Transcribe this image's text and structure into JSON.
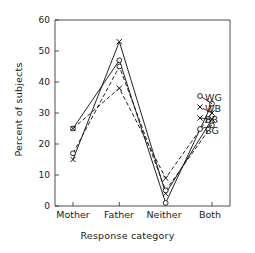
{
  "chart_data": {
    "type": "line",
    "title": "",
    "xlabel": "Response category",
    "ylabel": "Percent of subjects",
    "categories": [
      "Mother",
      "Father",
      "Neither",
      "Both"
    ],
    "ylim": [
      0,
      60
    ],
    "yticks": [
      0,
      10,
      20,
      30,
      40,
      50,
      60
    ],
    "ytick_labels": [
      "0",
      "10",
      "20",
      "30",
      "40",
      "50",
      "60"
    ],
    "grid": false,
    "legend_position": "right-inside",
    "series": [
      {
        "name": "WG",
        "marker": "circle",
        "linestyle": "solid",
        "values": [
          25,
          47,
          1,
          33
        ]
      },
      {
        "name": "WB",
        "marker": "x",
        "linestyle": "dashed",
        "values": [
          25,
          38,
          9,
          30
        ]
      },
      {
        "name": "BB",
        "marker": "x",
        "linestyle": "solid",
        "values": [
          15,
          53,
          4,
          28
        ]
      },
      {
        "name": "BG",
        "marker": "circle",
        "linestyle": "dashed",
        "values": [
          17,
          45,
          5,
          26
        ]
      }
    ]
  },
  "axis": {
    "y_label": "Percent of subjects",
    "x_label": "Response category",
    "y_tick_0": "0",
    "y_tick_1": "10",
    "y_tick_2": "20",
    "y_tick_3": "30",
    "y_tick_4": "40",
    "y_tick_5": "50",
    "y_tick_6": "60",
    "x_cat_0": "Mother",
    "x_cat_1": "Father",
    "x_cat_2": "Neither",
    "x_cat_3": "Both"
  },
  "legend": {
    "entry_0": "WG",
    "entry_1": "WB",
    "entry_2": "BB",
    "entry_3": "BG"
  },
  "style": {
    "line_color": "#151515",
    "axis_color": "#3a3a3a",
    "background": "#ffffff"
  }
}
